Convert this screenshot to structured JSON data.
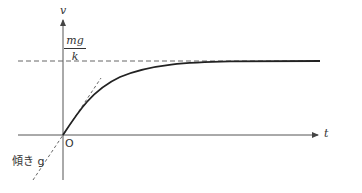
{
  "diagram": {
    "axes": {
      "vertical_label": "v",
      "horizontal_label": "t",
      "origin_label": "O"
    },
    "asymptote": {
      "label_numerator": "mg",
      "label_denominator": "k"
    },
    "tangent": {
      "label": "傾き g"
    },
    "colors": {
      "axis": "#555555",
      "curve": "#222222",
      "dashed": "#666666",
      "text": "#333333"
    }
  }
}
